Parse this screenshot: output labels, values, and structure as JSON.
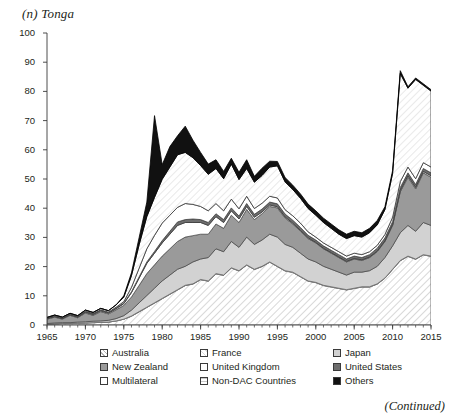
{
  "panel": {
    "title": "(n) Tonga",
    "continued_note": "(Continued)"
  },
  "chart_data": {
    "type": "area",
    "stacked": true,
    "title": "(n) Tonga",
    "xlabel": "",
    "ylabel": "",
    "xlim": [
      1965,
      2015
    ],
    "ylim": [
      0,
      100
    ],
    "ytick_values": [
      0,
      10,
      20,
      30,
      40,
      50,
      60,
      70,
      80,
      90,
      100
    ],
    "ytick_labels": [
      "0",
      "10",
      "20",
      "30",
      "40",
      "50",
      "60",
      "70",
      "80",
      "90",
      "100"
    ],
    "xtick_values": [
      1965,
      1970,
      1975,
      1980,
      1985,
      1990,
      1995,
      2000,
      2005,
      2010,
      2015
    ],
    "xtick_labels": [
      "1965",
      "1970",
      "1975",
      "1980",
      "1985",
      "1990",
      "1995",
      "2000",
      "2005",
      "2010",
      "2015"
    ],
    "minor_xticks": "every 1 year",
    "grid": false,
    "legend_position": "below-axes",
    "x": [
      1965,
      1966,
      1967,
      1968,
      1969,
      1970,
      1971,
      1972,
      1973,
      1974,
      1975,
      1976,
      1977,
      1978,
      1979,
      1980,
      1981,
      1982,
      1983,
      1984,
      1985,
      1986,
      1987,
      1988,
      1989,
      1990,
      1991,
      1992,
      1993,
      1994,
      1995,
      1996,
      1997,
      1998,
      1999,
      2000,
      2001,
      2002,
      2003,
      2004,
      2005,
      2006,
      2007,
      2008,
      2009,
      2010,
      2011,
      2012,
      2013,
      2014,
      2015
    ],
    "series": [
      {
        "name": "Australia",
        "fill": "diagonal-hatch-light",
        "values": [
          0.3,
          0.4,
          0.5,
          0.5,
          0.6,
          0.7,
          0.8,
          0.9,
          1.0,
          1.4,
          2.0,
          3.0,
          4.5,
          6.0,
          7.5,
          9.0,
          10.5,
          12.0,
          13.5,
          14.0,
          15.5,
          15.0,
          17.5,
          17.0,
          19.5,
          18.5,
          20.5,
          19.0,
          20.0,
          21.5,
          20.0,
          18.5,
          18.0,
          16.5,
          15.0,
          14.5,
          13.5,
          13.0,
          12.5,
          12.0,
          12.5,
          13.0,
          13.0,
          14.0,
          16.0,
          19.0,
          22.0,
          23.5,
          22.5,
          24.0,
          23.5
        ]
      },
      {
        "name": "France",
        "fill": "white-thin-outline",
        "values": [
          0.0,
          0.0,
          0.0,
          0.0,
          0.0,
          0.0,
          0.0,
          0.0,
          0.0,
          0.0,
          0.0,
          0.1,
          0.1,
          0.1,
          0.1,
          0.1,
          0.1,
          0.1,
          0.1,
          0.1,
          0.1,
          0.1,
          0.1,
          0.1,
          0.1,
          0.1,
          0.1,
          0.1,
          0.1,
          0.1,
          0.1,
          0.1,
          0.1,
          0.1,
          0.1,
          0.1,
          0.1,
          0.1,
          0.1,
          0.1,
          0.1,
          0.1,
          0.1,
          0.1,
          0.1,
          0.1,
          0.1,
          0.1,
          0.1,
          0.1,
          0.1
        ]
      },
      {
        "name": "Japan",
        "fill": "light-gray",
        "values": [
          0.2,
          0.3,
          0.3,
          0.3,
          0.4,
          0.4,
          0.5,
          0.5,
          0.6,
          0.8,
          1.2,
          2.0,
          3.0,
          4.0,
          5.0,
          6.0,
          6.5,
          7.0,
          6.5,
          7.5,
          7.0,
          8.0,
          8.5,
          8.0,
          9.0,
          8.0,
          9.5,
          8.5,
          9.0,
          9.5,
          10.0,
          9.0,
          8.5,
          8.0,
          7.5,
          7.0,
          6.5,
          6.0,
          5.5,
          5.0,
          5.5,
          5.0,
          5.5,
          6.0,
          7.0,
          8.0,
          9.5,
          10.5,
          9.5,
          11.0,
          10.5
        ]
      },
      {
        "name": "New Zealand",
        "fill": "medium-gray",
        "values": [
          1.5,
          2.0,
          1.2,
          2.5,
          1.5,
          3.0,
          2.0,
          3.2,
          2.2,
          3.0,
          3.5,
          4.5,
          6.0,
          7.5,
          8.0,
          8.5,
          9.0,
          9.5,
          10.0,
          9.0,
          8.5,
          8.0,
          8.5,
          8.0,
          9.0,
          8.5,
          9.5,
          8.5,
          9.0,
          9.5,
          10.0,
          9.0,
          8.0,
          7.5,
          7.0,
          6.5,
          6.0,
          5.5,
          5.0,
          4.5,
          4.5,
          4.0,
          4.5,
          5.0,
          5.5,
          7.0,
          14.0,
          16.5,
          14.5,
          17.0,
          16.5
        ]
      },
      {
        "name": "United Kingdom",
        "fill": "white",
        "values": [
          0.2,
          0.2,
          0.2,
          0.2,
          0.2,
          0.3,
          0.3,
          0.3,
          0.3,
          0.4,
          0.6,
          1.5,
          2.5,
          3.5,
          4.0,
          4.5,
          5.0,
          5.5,
          5.0,
          4.5,
          4.0,
          3.0,
          2.5,
          2.0,
          1.5,
          1.2,
          1.0,
          0.8,
          0.6,
          0.5,
          0.4,
          0.4,
          0.3,
          0.3,
          0.3,
          0.2,
          0.2,
          0.2,
          0.2,
          0.2,
          0.2,
          0.2,
          0.2,
          0.2,
          0.2,
          0.3,
          0.5,
          0.5,
          0.5,
          0.5,
          0.5
        ]
      },
      {
        "name": "United States",
        "fill": "dark-gray",
        "values": [
          0.1,
          0.1,
          0.1,
          0.1,
          0.1,
          0.1,
          0.1,
          0.1,
          0.1,
          0.2,
          0.2,
          0.3,
          0.4,
          0.5,
          0.6,
          0.8,
          1.0,
          1.2,
          1.0,
          1.2,
          1.0,
          1.0,
          1.0,
          1.0,
          1.0,
          1.0,
          1.0,
          1.0,
          1.0,
          1.0,
          1.0,
          1.0,
          1.0,
          1.0,
          0.8,
          0.8,
          0.8,
          0.8,
          0.8,
          0.8,
          0.8,
          0.8,
          0.8,
          1.0,
          1.0,
          1.0,
          1.0,
          1.0,
          1.0,
          1.0,
          1.0
        ]
      },
      {
        "name": "Multilateral",
        "fill": "white-outline",
        "values": [
          0.1,
          0.1,
          0.1,
          0.1,
          0.1,
          0.2,
          0.2,
          0.2,
          0.2,
          0.3,
          0.5,
          1.5,
          3.0,
          4.5,
          5.5,
          6.0,
          5.5,
          5.0,
          5.5,
          5.0,
          4.5,
          4.0,
          3.5,
          3.0,
          3.0,
          2.5,
          2.5,
          2.0,
          2.0,
          2.0,
          2.0,
          1.5,
          1.5,
          1.5,
          1.2,
          1.0,
          1.0,
          1.0,
          1.0,
          1.0,
          1.0,
          1.0,
          1.0,
          1.0,
          1.2,
          1.5,
          2.0,
          2.0,
          2.0,
          2.0,
          2.0
        ]
      },
      {
        "name": "Non-DAC Countries",
        "fill": "diagonal-hatch-very-light",
        "values": [
          0.2,
          0.3,
          0.3,
          0.3,
          0.3,
          0.4,
          0.4,
          0.5,
          0.5,
          0.8,
          1.5,
          4.0,
          8.0,
          11.0,
          13.0,
          15.0,
          16.5,
          18.0,
          17.5,
          16.0,
          14.0,
          12.5,
          12.0,
          11.0,
          12.0,
          10.0,
          9.5,
          9.0,
          9.5,
          10.0,
          11.0,
          9.5,
          9.0,
          8.5,
          8.0,
          7.5,
          7.0,
          6.5,
          6.0,
          6.0,
          6.0,
          6.0,
          6.5,
          7.0,
          8.5,
          15.0,
          37.0,
          27.0,
          34.0,
          26.5,
          26.0
        ]
      },
      {
        "name": "Others",
        "fill": "black",
        "values": [
          0.0,
          0.0,
          0.0,
          0.0,
          0.0,
          0.0,
          0.0,
          0.0,
          0.0,
          0.0,
          0.5,
          1.0,
          2.5,
          5.0,
          28.0,
          5.0,
          7.0,
          6.5,
          9.0,
          6.0,
          4.5,
          3.5,
          3.0,
          2.5,
          2.0,
          2.5,
          3.0,
          2.0,
          2.5,
          2.0,
          1.5,
          1.5,
          1.5,
          1.5,
          1.5,
          1.5,
          1.5,
          1.5,
          1.5,
          1.5,
          1.5,
          1.5,
          1.5,
          1.5,
          1.0,
          1.0,
          1.0,
          0.5,
          0.5,
          0.5,
          0.5
        ]
      }
    ],
    "annotations": [
      {
        "label": "peak total",
        "x": 2011,
        "y": 87
      },
      {
        "label": "Others spike",
        "x": 1979,
        "y": 67
      }
    ]
  },
  "legend": {
    "entries": [
      {
        "label": "Australia",
        "fill": "diagonal-hatch-light"
      },
      {
        "label": "France",
        "fill": "white-thin-outline"
      },
      {
        "label": "Japan",
        "fill": "light-gray"
      },
      {
        "label": "New Zealand",
        "fill": "medium-gray"
      },
      {
        "label": "United Kingdom",
        "fill": "white"
      },
      {
        "label": "United States",
        "fill": "dark-gray"
      },
      {
        "label": "Multilateral",
        "fill": "white-outline"
      },
      {
        "label": "Non-DAC Countries",
        "fill": "diagonal-hatch-very-light"
      },
      {
        "label": "Others",
        "fill": "black"
      }
    ]
  },
  "colors": {
    "axis": "#3a3a3a",
    "text": "#231f20",
    "light_gray": "#d2d2d2",
    "medium_gray": "#9a9a9a",
    "dark_gray": "#6e6e6e",
    "black": "#111111",
    "white": "#ffffff",
    "hatch_light": "#f2f2f2",
    "hatch_very_light": "#f7f7f7"
  }
}
